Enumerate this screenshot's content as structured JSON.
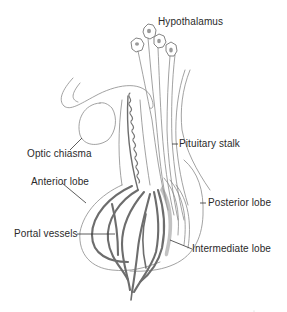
{
  "figure": {
    "labels": {
      "hypothalamus": "Hypothalamus",
      "optic_chiasma": "Optic chiasma",
      "pituitary_stalk": "Pituitary stalk",
      "anterior_lobe": "Anterior lobe",
      "posterior_lobe": "Posterior lobe",
      "portal_vessels": "Portal vessels",
      "intermediate_lobe": "Intermediate lobe"
    },
    "colors": {
      "background": "#ffffff",
      "line": "#777777",
      "text": "#2a2a2a"
    }
  }
}
